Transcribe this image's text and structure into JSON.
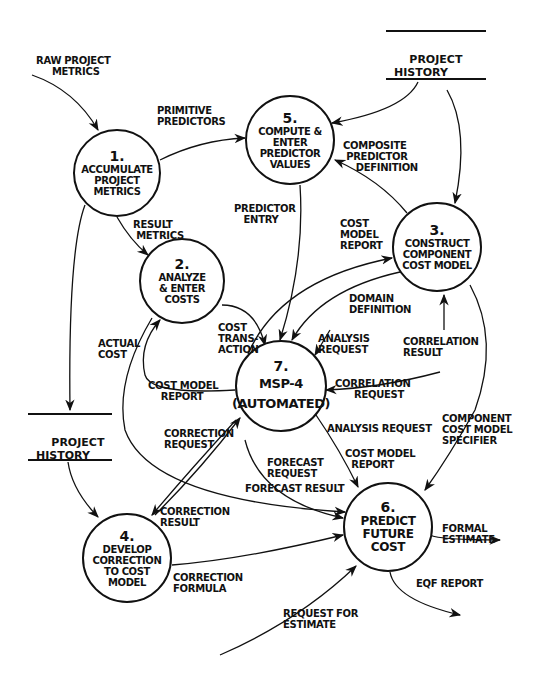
{
  "diagram": {
    "type": "data-flow-diagram",
    "processes": [
      {
        "id": "p1",
        "number": "1.",
        "name": "ACCUMULATE\nPROJECT\nMETRICS"
      },
      {
        "id": "p2",
        "number": "2.",
        "name": "ANALYZE\n& ENTER\nCOSTS"
      },
      {
        "id": "p3",
        "number": "3.",
        "name": "CONSTRUCT\nCOMPONENT\nCOST MODEL"
      },
      {
        "id": "p4",
        "number": "4.",
        "name": "DEVELOP\nCORRECTION\nTO COST\nMODEL"
      },
      {
        "id": "p5",
        "number": "5.",
        "name": "COMPUTE &\nENTER\nPREDICTOR\nVALUES"
      },
      {
        "id": "p6",
        "number": "6.",
        "name": "PREDICT\nFUTURE\nCOST"
      },
      {
        "id": "p7",
        "number": "7.",
        "name": "MSP-4\n(AUTOMATED)"
      }
    ],
    "stores": [
      {
        "id": "s_top",
        "name": "PROJECT\nHISTORY"
      },
      {
        "id": "s_left",
        "name": "PROJECT\nHISTORY"
      }
    ],
    "flows": [
      {
        "label": "RAW PROJECT\nMETRICS",
        "from": "external",
        "to": "p1"
      },
      {
        "label": "PRIMITIVE\nPREDICTORS",
        "from": "p1",
        "to": "p5"
      },
      {
        "label": "RESULT\nMETRICS",
        "from": "p1",
        "to": "p2"
      },
      {
        "label": "",
        "from": "p1",
        "to": "s_left"
      },
      {
        "label": "",
        "from": "s_top",
        "to": "p5"
      },
      {
        "label": "",
        "from": "s_top",
        "to": "p3"
      },
      {
        "label": "COMPOSITE\nPREDICTOR\nDEFINITION",
        "from": "p3",
        "to": "p5"
      },
      {
        "label": "PREDICTOR\nENTRY",
        "from": "p5",
        "to": "p7"
      },
      {
        "label": "COST\nMODEL\nREPORT",
        "from": "p7",
        "to": "p3"
      },
      {
        "label": "DOMAIN\nDEFINITION",
        "from": "p3",
        "to": "p7"
      },
      {
        "label": "ANALYSIS\nREQUEST",
        "from": "p7",
        "to": "p3"
      },
      {
        "label": "CORRELATION\nRESULT",
        "from": "p7",
        "to": "p3"
      },
      {
        "label": "CORRELATION\nREQUEST",
        "from": "p3",
        "to": "p7"
      },
      {
        "label": "COST\nTRANS-\nACTION",
        "from": "p2",
        "to": "p7"
      },
      {
        "label": "COST MODEL\nREPORT",
        "from": "p7",
        "to": "p2"
      },
      {
        "label": "ACTUAL\nCOST",
        "from": "p2",
        "to": "p6"
      },
      {
        "label": "CORRECTION\nREQUEST",
        "from": "p4",
        "to": "p7"
      },
      {
        "label": "CORRECTION\nRESULT",
        "from": "p7",
        "to": "p4"
      },
      {
        "label": "ANALYSIS REQUEST",
        "from": "p7",
        "to": "p6"
      },
      {
        "label": "COST MODEL\nREPORT",
        "from": "p7",
        "to": "p6"
      },
      {
        "label": "FORECAST\nREQUEST",
        "from": "p6",
        "to": "p7"
      },
      {
        "label": "FORECAST RESULT",
        "from": "p7",
        "to": "p6"
      },
      {
        "label": "COMPONENT\nCOST MODEL\nSPECIFIER",
        "from": "p3",
        "to": "p6"
      },
      {
        "label": "",
        "from": "s_left",
        "to": "p4"
      },
      {
        "label": "CORRECTION\nFORMULA",
        "from": "p4",
        "to": "p6"
      },
      {
        "label": "FORMAL\nESTIMATE",
        "from": "p6",
        "to": "external"
      },
      {
        "label": "EQF REPORT",
        "from": "p6",
        "to": "external"
      },
      {
        "label": "REQUEST FOR\nESTIMATE",
        "from": "external",
        "to": "p6"
      }
    ]
  },
  "labels": {
    "raw_project_metrics": "RAW PROJECT\n     METRICS",
    "primitive_predictors": "PRIMITIVE\nPREDICTORS",
    "result_metrics": "RESULT\n METRICS",
    "composite_predictor_definition": "COMPOSITE\n PREDICTOR\n    DEFINITION",
    "predictor_entry": "PREDICTOR\n   ENTRY",
    "cost_model_report_p3": "COST\nMODEL\nREPORT",
    "domain_definition": "DOMAIN\nDEFINITION",
    "analysis_request_p3": "ANALYSIS\nREQUEST",
    "correlation_result": "CORRELATION\nRESULT",
    "correlation_request": "CORRELATION\n      REQUEST",
    "cost_transaction": "COST\nTRANS-\nACTION",
    "actual_cost": "ACTUAL\nCOST",
    "cost_model_report_p2": "COST MODEL\n    REPORT",
    "correction_request": "CORRECTION\nREQUEST",
    "analysis_request_p6": "ANALYSIS REQUEST",
    "cost_model_report_p6": "COST MODEL\n  REPORT",
    "forecast_request": "FORECAST\nREQUEST",
    "forecast_result": "FORECAST RESULT",
    "component_cost_model_specifier": "COMPONENT\nCOST MODEL\nSPECIFIER",
    "correction_result": "CORRECTION\nRESULT",
    "correction_formula": "CORRECTION\nFORMULA",
    "formal_estimate": "FORMAL\nESTIMATE",
    "eqf_report": "EQF REPORT",
    "request_for_estimate": "REQUEST FOR\nESTIMATE"
  },
  "colors": {
    "ink": "#111111",
    "paper": "#ffffff"
  }
}
